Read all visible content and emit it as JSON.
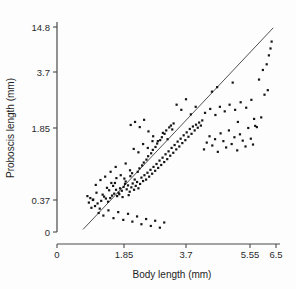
{
  "chart_data": {
    "type": "scatter",
    "title": "",
    "xlabel": "Body length (mm)",
    "ylabel": "Proboscis length (mm)",
    "xlim": [
      0,
      6.5
    ],
    "ylim": [
      0,
      14.8
    ],
    "grid": false,
    "legend": "none",
    "x_scale": "linear-from-0",
    "y_scale": "compressed-upper",
    "xticks": [
      0,
      1.85,
      3.7,
      5.55,
      6.5
    ],
    "xticklabels": [
      "0",
      "1.85",
      "3.7",
      "5.55",
      "6.5"
    ],
    "yticks": [
      0,
      0.37,
      1.85,
      3.7,
      14.8
    ],
    "yticklabels": [
      "0",
      "0.37",
      "1.85",
      "3.7",
      "14.8"
    ],
    "fit_line": {
      "label": "regression line",
      "x_start": 0.72,
      "y_start": 0.03,
      "x_end": 6.4,
      "y_end": 14.6
    },
    "series": [
      {
        "name": "specimens",
        "marker": "filled-square",
        "marker_color": "#151515",
        "n_points": 192,
        "points": [
          [
            1.12,
            0.33
          ],
          [
            1.05,
            0.3
          ],
          [
            1.18,
            0.27
          ],
          [
            1.0,
            0.38
          ],
          [
            1.22,
            0.36
          ],
          [
            1.3,
            0.44
          ],
          [
            1.09,
            0.52
          ],
          [
            1.35,
            0.4
          ],
          [
            1.41,
            0.35
          ],
          [
            1.26,
            0.48
          ],
          [
            1.44,
            0.57
          ],
          [
            1.52,
            0.46
          ],
          [
            1.38,
            0.62
          ],
          [
            1.58,
            0.5
          ],
          [
            1.47,
            0.41
          ],
          [
            1.63,
            0.58
          ],
          [
            1.55,
            0.66
          ],
          [
            1.7,
            0.52
          ],
          [
            1.66,
            0.45
          ],
          [
            1.74,
            0.61
          ],
          [
            1.6,
            0.72
          ],
          [
            1.79,
            0.56
          ],
          [
            1.84,
            0.64
          ],
          [
            1.72,
            0.49
          ],
          [
            1.88,
            0.7
          ],
          [
            1.81,
            0.43
          ],
          [
            1.93,
            0.59
          ],
          [
            1.97,
            0.67
          ],
          [
            1.9,
            0.75
          ],
          [
            2.02,
            0.54
          ],
          [
            1.86,
            0.81
          ],
          [
            2.07,
            0.63
          ],
          [
            2.11,
            0.71
          ],
          [
            1.99,
            0.47
          ],
          [
            2.15,
            0.58
          ],
          [
            2.04,
            0.86
          ],
          [
            2.2,
            0.66
          ],
          [
            2.24,
            0.74
          ],
          [
            2.09,
            0.92
          ],
          [
            2.28,
            0.61
          ],
          [
            2.17,
            0.79
          ],
          [
            2.33,
            0.7
          ],
          [
            2.37,
            0.83
          ],
          [
            2.26,
            0.95
          ],
          [
            2.42,
            0.76
          ],
          [
            2.31,
            1.02
          ],
          [
            2.46,
            0.88
          ],
          [
            2.51,
            0.79
          ],
          [
            2.39,
            1.08
          ],
          [
            2.55,
            0.93
          ],
          [
            2.44,
            1.14
          ],
          [
            2.6,
            0.85
          ],
          [
            2.64,
            0.99
          ],
          [
            2.52,
            1.2
          ],
          [
            2.69,
            0.91
          ],
          [
            2.57,
            1.27
          ],
          [
            2.73,
            1.05
          ],
          [
            2.78,
            0.97
          ],
          [
            2.66,
            1.33
          ],
          [
            2.82,
            1.11
          ],
          [
            2.71,
            1.4
          ],
          [
            2.87,
            1.03
          ],
          [
            2.91,
            1.18
          ],
          [
            2.79,
            1.46
          ],
          [
            2.96,
            1.09
          ],
          [
            2.84,
            1.53
          ],
          [
            3.0,
            1.24
          ],
          [
            3.05,
            1.15
          ],
          [
            2.93,
            1.6
          ],
          [
            3.09,
            1.31
          ],
          [
            2.98,
            1.66
          ],
          [
            3.14,
            1.21
          ],
          [
            3.18,
            1.37
          ],
          [
            3.06,
            1.73
          ],
          [
            3.23,
            1.28
          ],
          [
            3.11,
            1.8
          ],
          [
            3.27,
            1.44
          ],
          [
            3.32,
            1.34
          ],
          [
            3.2,
            1.87
          ],
          [
            3.36,
            1.5
          ],
          [
            3.25,
            1.93
          ],
          [
            3.41,
            1.41
          ],
          [
            3.45,
            1.57
          ],
          [
            3.33,
            2.0
          ],
          [
            3.5,
            1.47
          ],
          [
            3.54,
            1.63
          ],
          [
            3.59,
            1.54
          ],
          [
            3.63,
            1.7
          ],
          [
            3.68,
            1.6
          ],
          [
            3.72,
            1.76
          ],
          [
            3.77,
            1.67
          ],
          [
            3.81,
            1.83
          ],
          [
            3.86,
            1.73
          ],
          [
            3.9,
            1.9
          ],
          [
            3.95,
            1.8
          ],
          [
            3.99,
            1.96
          ],
          [
            4.04,
            1.86
          ],
          [
            4.08,
            2.03
          ],
          [
            4.13,
            1.93
          ],
          [
            4.17,
            2.1
          ],
          [
            1.15,
            0.22
          ],
          [
            1.28,
            0.19
          ],
          [
            1.42,
            0.25
          ],
          [
            1.56,
            0.16
          ],
          [
            1.69,
            0.23
          ],
          [
            1.83,
            0.14
          ],
          [
            1.97,
            0.21
          ],
          [
            2.1,
            0.12
          ],
          [
            2.24,
            0.18
          ],
          [
            2.37,
            0.09
          ],
          [
            2.51,
            0.15
          ],
          [
            2.65,
            0.07
          ],
          [
            2.78,
            0.13
          ],
          [
            2.92,
            0.05
          ],
          [
            3.05,
            0.11
          ],
          [
            0.92,
            0.41
          ],
          [
            0.88,
            0.34
          ],
          [
            0.95,
            0.28
          ],
          [
            0.84,
            0.45
          ],
          [
            0.99,
            0.37
          ],
          [
            4.22,
            1.41
          ],
          [
            4.3,
            1.55
          ],
          [
            4.38,
            1.68
          ],
          [
            4.46,
            1.49
          ],
          [
            4.54,
            1.62
          ],
          [
            4.62,
            1.36
          ],
          [
            4.7,
            1.74
          ],
          [
            4.78,
            1.58
          ],
          [
            4.86,
            1.45
          ],
          [
            4.94,
            1.8
          ],
          [
            5.02,
            1.52
          ],
          [
            5.1,
            1.66
          ],
          [
            5.18,
            1.39
          ],
          [
            5.26,
            1.72
          ],
          [
            5.34,
            1.59
          ],
          [
            5.42,
            1.47
          ],
          [
            5.5,
            1.85
          ],
          [
            5.58,
            1.63
          ],
          [
            5.66,
            1.51
          ],
          [
            5.74,
            1.92
          ],
          [
            4.25,
            2.35
          ],
          [
            4.4,
            2.48
          ],
          [
            4.55,
            2.28
          ],
          [
            4.68,
            2.55
          ],
          [
            4.82,
            2.4
          ],
          [
            4.96,
            2.62
          ],
          [
            5.12,
            2.45
          ],
          [
            5.28,
            2.7
          ],
          [
            5.44,
            2.52
          ],
          [
            5.6,
            2.78
          ],
          [
            5.88,
            3.45
          ],
          [
            6.02,
            4.2
          ],
          [
            6.16,
            5.6
          ],
          [
            6.24,
            7.8
          ],
          [
            6.3,
            9.5
          ],
          [
            6.08,
            2.95
          ],
          [
            5.96,
            2.2
          ],
          [
            5.8,
            1.88
          ],
          [
            6.2,
            3.1
          ],
          [
            6.34,
            11.2
          ],
          [
            2.05,
            1.95
          ],
          [
            2.18,
            2.05
          ],
          [
            2.32,
            1.88
          ],
          [
            2.45,
            2.12
          ],
          [
            2.58,
            1.78
          ],
          [
            3.42,
            2.62
          ],
          [
            3.56,
            2.45
          ],
          [
            3.7,
            2.8
          ],
          [
            3.84,
            2.3
          ],
          [
            3.98,
            2.55
          ],
          [
            1.48,
            0.95
          ],
          [
            1.62,
            1.05
          ],
          [
            1.76,
            0.88
          ],
          [
            1.9,
            1.12
          ],
          [
            2.03,
            0.98
          ],
          [
            1.33,
            0.85
          ],
          [
            1.2,
            0.78
          ],
          [
            1.07,
            0.68
          ],
          [
            1.5,
            0.72
          ],
          [
            1.64,
            0.82
          ],
          [
            2.72,
            1.68
          ],
          [
            2.86,
            1.58
          ],
          [
            3.01,
            1.75
          ],
          [
            3.15,
            1.62
          ],
          [
            3.29,
            1.82
          ],
          [
            2.14,
            1.42
          ],
          [
            2.28,
            1.35
          ],
          [
            2.42,
            1.52
          ],
          [
            2.56,
            1.44
          ],
          [
            2.7,
            1.58
          ],
          [
            4.45,
            3.05
          ],
          [
            4.6,
            3.2
          ],
          [
            5.05,
            3.35
          ],
          [
            5.2,
            2.05
          ],
          [
            5.7,
            2.15
          ]
        ]
      }
    ]
  }
}
